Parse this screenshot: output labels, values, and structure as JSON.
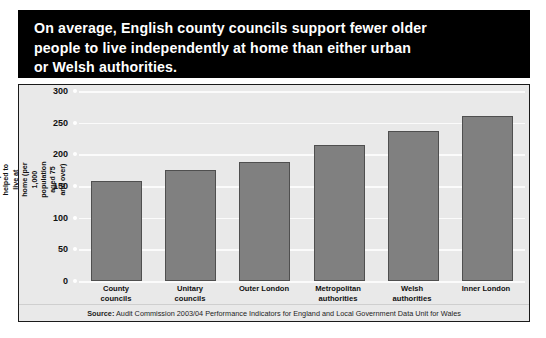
{
  "title": {
    "text": "On average, English county councils support fewer older\npeople to live independently at home than either urban\nor Welsh authorities."
  },
  "source": {
    "label": "Source:",
    "text": " Audit Commission 2003/04 Performance Indicators for England and Local Government Data Unit for Wales"
  },
  "colors": {
    "bar_fill": "#808080",
    "bar_edge": "#4f4f4f",
    "plot_background": "#e9e9e9",
    "gridline": "#fbfbfb",
    "banner_background": "#000000",
    "banner_text": "#ffffff",
    "frame_border": "#1a1a1a"
  },
  "chart_data": {
    "type": "bar",
    "title": "On average, English county councils support fewer older people to live independently at home than either urban or Welsh authorities.",
    "categories": [
      "County\ncouncils",
      "Unitary\ncouncils",
      "Outer London",
      "Metropolitan\nauthorities",
      "Welsh\nauthorities",
      "Inner London"
    ],
    "values": [
      158,
      175,
      188,
      215,
      237,
      261
    ],
    "xlabel": "",
    "ylabel": "People helped to live at home (per 1,000\npopulation aged 75 and over)",
    "ylim": [
      0,
      300
    ],
    "yticks": [
      0,
      50,
      100,
      150,
      200,
      250,
      300
    ],
    "ytick_labels": [
      "0",
      "50",
      "100",
      "150",
      "200",
      "250",
      "300"
    ],
    "grid": true,
    "legend": false,
    "source": "Source: Audit Commission 2003/04 Performance Indicators for England and Local Government Data Unit for Wales"
  }
}
